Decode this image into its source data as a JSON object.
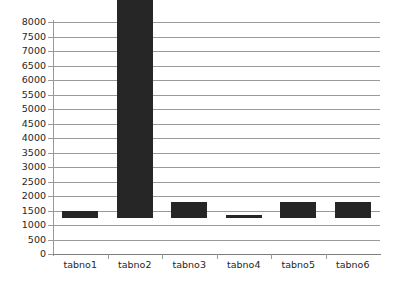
{
  "chart_data": {
    "type": "bar",
    "title": "",
    "subtitle": "",
    "xlabel": "",
    "ylabel": "",
    "categories": [
      "tabno1",
      "tabno2",
      "tabno3",
      "tabno4",
      "tabno5",
      "tabno6"
    ],
    "values": [
      230,
      7780,
      550,
      100,
      560,
      550
    ],
    "series": [
      {
        "name": "",
        "values": [
          230,
          7780,
          550,
          100,
          560,
          550
        ]
      }
    ],
    "ylim": [
      0,
      8000
    ],
    "ytick_values": [
      0,
      500,
      1000,
      1500,
      2000,
      2500,
      3000,
      3500,
      4000,
      4500,
      5000,
      5500,
      6000,
      6500,
      7000,
      7500,
      8000
    ],
    "ytick_labels": [
      "0",
      "500",
      "1000",
      "1500",
      "2000",
      "2500",
      "3000",
      "3500",
      "4000",
      "4500",
      "5000",
      "5500",
      "6000",
      "6500",
      "7000",
      "7500",
      "8000"
    ],
    "grid": true,
    "grid_axis": "y",
    "legend": false,
    "legend_position": "none",
    "bar_color": "#262626",
    "grid_color": "#9a9a9a",
    "axis_color": "#7d7d7d",
    "text_color": "#262626",
    "background_color": "#ffffff",
    "annotations": []
  }
}
